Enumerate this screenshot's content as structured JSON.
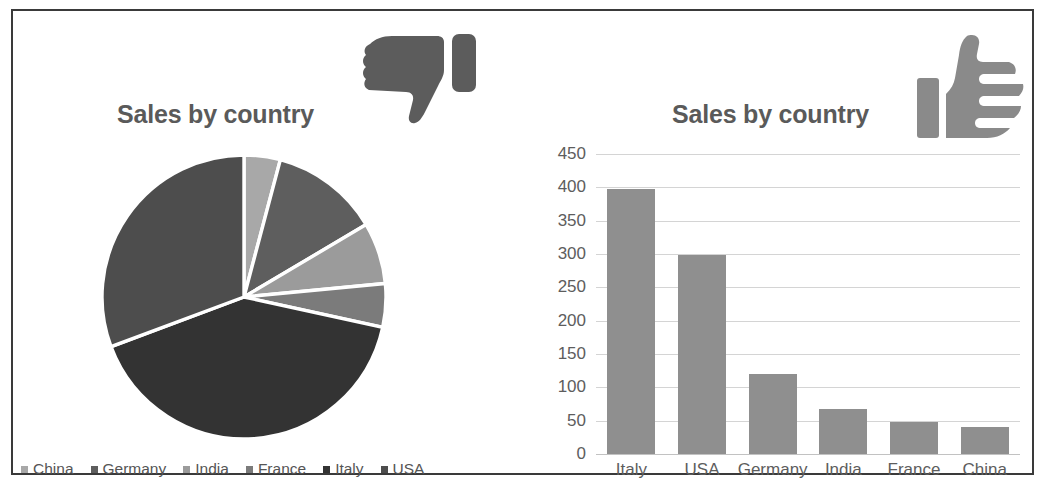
{
  "figure": {
    "border_color": "#3a3a3a",
    "background": "#ffffff"
  },
  "panels": {
    "left": {
      "title": "Sales by country",
      "annotation_icon": "thumbs-down-icon",
      "verdict": "bad"
    },
    "right": {
      "title": "Sales by country",
      "annotation_icon": "thumbs-up-icon",
      "verdict": "good"
    }
  },
  "chart_data": [
    {
      "type": "pie",
      "title": "Sales by country",
      "labels": [
        "China",
        "Germany",
        "India",
        "France",
        "Italy",
        "USA"
      ],
      "values": [
        40,
        120,
        68,
        48,
        397,
        298
      ],
      "colors": [
        "#a8a8a8",
        "#5e5e5e",
        "#9b9b9b",
        "#7b7b7b",
        "#333333",
        "#4d4d4d"
      ],
      "start_angle_deg": 0,
      "direction": "clockwise",
      "slice_gap": true,
      "legend": {
        "position": "bottom",
        "entries": [
          {
            "label": "China",
            "color": "#a8a8a8"
          },
          {
            "label": "Germany",
            "color": "#5e5e5e"
          },
          {
            "label": "India",
            "color": "#9b9b9b"
          },
          {
            "label": "France",
            "color": "#7b7b7b"
          },
          {
            "label": "Italy",
            "color": "#333333"
          },
          {
            "label": "USA",
            "color": "#4d4d4d"
          }
        ]
      },
      "data_labels": false,
      "grid": false
    },
    {
      "type": "bar",
      "title": "Sales by country",
      "categories": [
        "Italy",
        "USA",
        "Germany",
        "India",
        "France",
        "China"
      ],
      "values": [
        397,
        298,
        120,
        68,
        48,
        40
      ],
      "xlabel": "",
      "ylabel": "",
      "ylim": [
        0,
        450
      ],
      "ytick_step": 50,
      "yticks": [
        "450",
        "400",
        "350",
        "300",
        "250",
        "200",
        "150",
        "100",
        "50",
        "0"
      ],
      "bar_color": "#8f8f8f",
      "grid": true,
      "gridline_color": "#d4d4d4",
      "legend": null,
      "data_labels": false
    }
  ]
}
